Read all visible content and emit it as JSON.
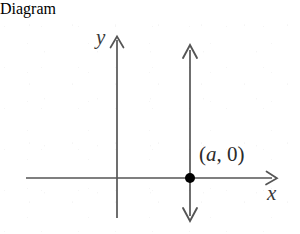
{
  "figure": {
    "type": "coordinate-plane-diagram",
    "background_color": "#ffffff",
    "stroke_color": "#555555",
    "point_color": "#000000",
    "text_color": "#2b2b2b",
    "width": 300,
    "height": 216
  },
  "axes": {
    "x_axis": {
      "label": "x",
      "y_position": 160,
      "x_start": 26,
      "x_end": 277,
      "arrow_end": "right"
    },
    "y_axis": {
      "label": "y",
      "x_position": 117,
      "y_start": 18,
      "y_end": 200,
      "arrow_end": "up"
    },
    "origin": {
      "x": 117,
      "y": 160
    }
  },
  "graph": {
    "vertical_line": {
      "name": "line-x-equals-a",
      "x_position": 190,
      "y_top": 28,
      "y_bottom": 202,
      "arrow_end": "both"
    },
    "point": {
      "label": "(a, 0)",
      "label_prefix": "(",
      "label_variable": "a",
      "label_suffix": ", 0)",
      "x": 190,
      "y": 160,
      "radius": 5,
      "filled": true
    }
  }
}
